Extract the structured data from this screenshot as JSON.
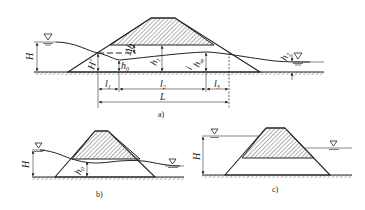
{
  "figure": {
    "colors": {
      "line": "#222222",
      "hatch": "#555555",
      "background": "#ffffff"
    }
  },
  "panel_a": {
    "caption": "a)",
    "labels": {
      "H": "H",
      "H_prime": "H'",
      "h0": "h",
      "h0_sub": "0",
      "delta_h": "Δh",
      "h1": "h",
      "h1_sub": "1",
      "hm": "h",
      "hm_sub": "m",
      "i": "i",
      "h2": "h",
      "h2_sub": "2",
      "l1": "l",
      "l1_sub": "1",
      "l2": "l",
      "l2_sub": "2",
      "l3": "l",
      "l3_sub": "3",
      "L": "L"
    },
    "icons": [
      "water-level-upstream-icon",
      "water-level-downstream-icon"
    ]
  },
  "panel_b": {
    "caption": "b)",
    "labels": {
      "H": "H",
      "h0": "h",
      "h0_sub": "0"
    },
    "icons": [
      "water-level-upstream-icon",
      "water-level-downstream-icon"
    ]
  },
  "panel_c": {
    "caption": "c)",
    "labels": {
      "H": "H"
    },
    "icons": [
      "water-level-upstream-icon",
      "water-level-downstream-icon"
    ]
  }
}
